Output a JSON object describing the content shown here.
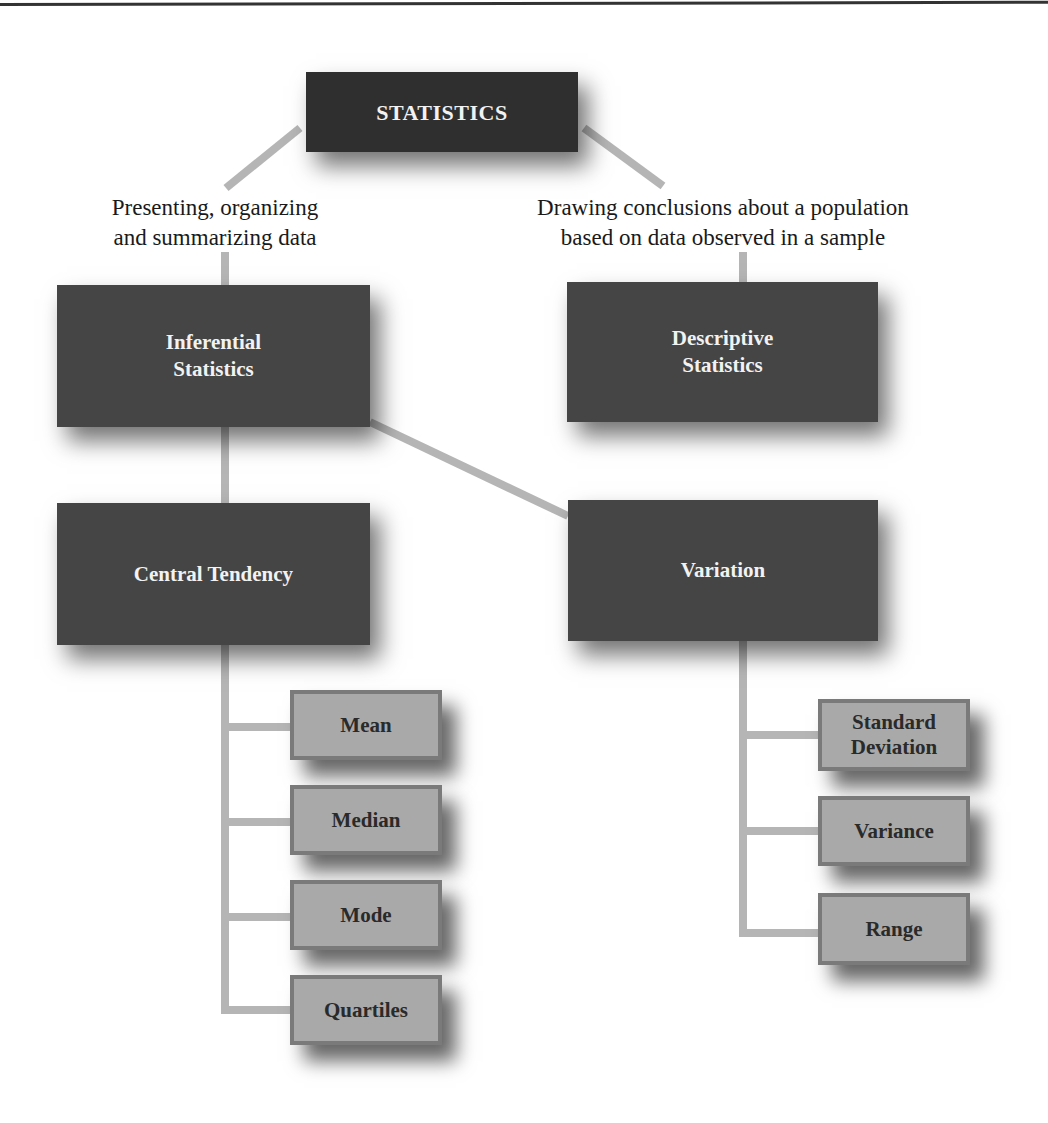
{
  "diagram": {
    "root": {
      "label": "STATISTICS"
    },
    "branch_labels": {
      "left": {
        "line1": "Presenting, organizing",
        "line2": "and summarizing data"
      },
      "right": {
        "line1": "Drawing conclusions about a population",
        "line2": "based on data observed in a sample"
      }
    },
    "level1": {
      "left": {
        "line1": "Inferential",
        "line2": "Statistics"
      },
      "right": {
        "line1": "Descriptive",
        "line2": "Statistics"
      }
    },
    "level2": {
      "left": {
        "label": "Central Tendency"
      },
      "right": {
        "label": "Variation"
      }
    },
    "central_tendency_items": [
      {
        "label": "Mean"
      },
      {
        "label": "Median"
      },
      {
        "label": "Mode"
      },
      {
        "label": "Quartiles"
      }
    ],
    "variation_items": [
      {
        "line1": "Standard",
        "line2": "Deviation"
      },
      {
        "label": "Variance"
      },
      {
        "label": "Range"
      }
    ],
    "colors": {
      "dark_box": "#454545",
      "root_box": "#2f2f2f",
      "small_box": "#a9a9a9",
      "small_box_border": "#7a7a7a",
      "connector": "#b5b5b5"
    }
  }
}
